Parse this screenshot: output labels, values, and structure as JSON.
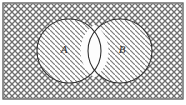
{
  "figure": {
    "name": "venn-diagram-two-sets",
    "caption": "",
    "universe_label": "",
    "background_fill": "cross-hatch",
    "colors": {
      "ink": "#3a3a3a",
      "outline": "#2f2f2f",
      "hatch": "#8a8a8a",
      "crosshatch": "#7d7d7d",
      "paper": "#ffffff",
      "frame": "#5a5a5a"
    },
    "frame": {
      "x": 3,
      "y": 3,
      "width": 180,
      "height": 96,
      "stroke_width": 1.2
    },
    "sets": [
      {
        "id": "A",
        "label": "A",
        "label_x": 64,
        "label_y": 53,
        "cx": 69,
        "cy": 51,
        "r": 32,
        "fill": "diagonal-hatch"
      },
      {
        "id": "B",
        "label": "B",
        "label_x": 122,
        "label_y": 53,
        "cx": 120,
        "cy": 51,
        "r": 32,
        "fill": "diagonal-hatch"
      }
    ],
    "regions": [
      {
        "id": "universe-outside",
        "name": "complement-of-A-union-B",
        "fill": "cross-hatch",
        "shaded": true
      },
      {
        "id": "A-only",
        "name": "A-minus-B",
        "fill": "diagonal-hatch",
        "shaded": true
      },
      {
        "id": "B-only",
        "name": "B-minus-A",
        "fill": "diagonal-hatch",
        "shaded": true
      },
      {
        "id": "A-intersect-B",
        "name": "A-intersection-B",
        "fill": "none",
        "shaded": false
      }
    ]
  }
}
